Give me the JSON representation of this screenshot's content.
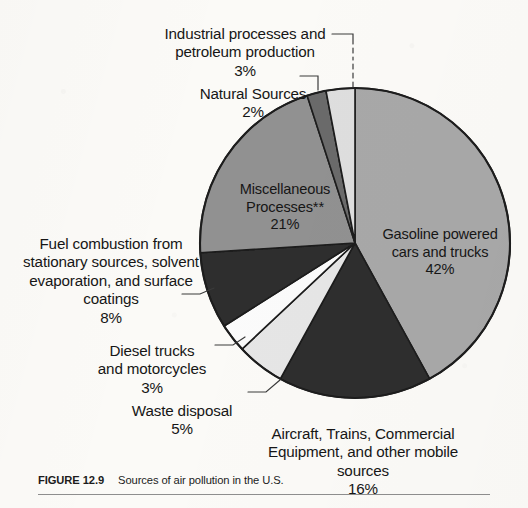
{
  "figure": {
    "caption_tag": "FIGURE 12.9",
    "caption_text": "Sources of air pollution in the U.S."
  },
  "chart_data": {
    "type": "pie",
    "title": "Sources of air pollution in the U.S.",
    "units": "percent",
    "start_angle_deg": 0,
    "direction": "clockwise",
    "legend": "none (direct labels with leader lines)",
    "categories": [
      "Gasoline powered cars and trucks",
      "Aircraft, Trains, Commercial Equipment, and other mobile sources",
      "Waste disposal",
      "Diesel trucks and motorcycles",
      "Fuel combustion from stationary sources, solvent evaporation, and surface coatings",
      "Miscellaneous Processes**",
      "Natural Sources",
      "Industrial processes and petroleum production"
    ],
    "values": [
      42,
      16,
      5,
      3,
      8,
      21,
      2,
      3
    ],
    "colors": [
      "#a8a8a8",
      "#2e2e2e",
      "#e6e6e6",
      "#fbfbfb",
      "#2e2e2e",
      "#919191",
      "#6a6a6a",
      "#dedede"
    ],
    "slices": [
      {
        "label": "Gasoline powered cars and trucks",
        "value": 42,
        "display": "42%",
        "color": "#a8a8a8"
      },
      {
        "label": "Aircraft, Trains, Commercial Equipment, and other mobile sources",
        "value": 16,
        "display": "16%",
        "color": "#2e2e2e"
      },
      {
        "label": "Waste disposal",
        "value": 5,
        "display": "5%",
        "color": "#e6e6e6"
      },
      {
        "label": "Diesel trucks and motorcycles",
        "value": 3,
        "display": "3%",
        "color": "#fbfbfb"
      },
      {
        "label": "Fuel combustion from stationary sources, solvent evaporation, and surface coatings",
        "value": 8,
        "display": "8%",
        "color": "#2e2e2e"
      },
      {
        "label": "Miscellaneous Processes**",
        "value": 21,
        "display": "21%",
        "color": "#919191"
      },
      {
        "label": "Natural Sources",
        "value": 2,
        "display": "2%",
        "color": "#6a6a6a"
      },
      {
        "label": "Industrial processes and petroleum production",
        "value": 3,
        "display": "3%",
        "color": "#dedede"
      }
    ]
  },
  "labels": {
    "industrial": {
      "name": "Industrial processes and\npetroleum production",
      "pct": "3%"
    },
    "natural": {
      "name": "Natural Sources",
      "pct": "2%"
    },
    "misc": {
      "name": "Miscellaneous\nProcesses**",
      "pct": "21%"
    },
    "gasoline": {
      "name": "Gasoline powered\ncars and trucks",
      "pct": "42%"
    },
    "fuel": {
      "name": "Fuel combustion from\nstationary sources, solvent\nevaporation, and surface\ncoatings",
      "pct": "8%"
    },
    "diesel": {
      "name": "Diesel trucks\nand motorcycles",
      "pct": "3%"
    },
    "waste": {
      "name": "Waste disposal",
      "pct": "5%"
    },
    "aircraft": {
      "name": "Aircraft, Trains, Commercial\nEquipment, and other mobile\nsources",
      "pct": "16%"
    }
  }
}
